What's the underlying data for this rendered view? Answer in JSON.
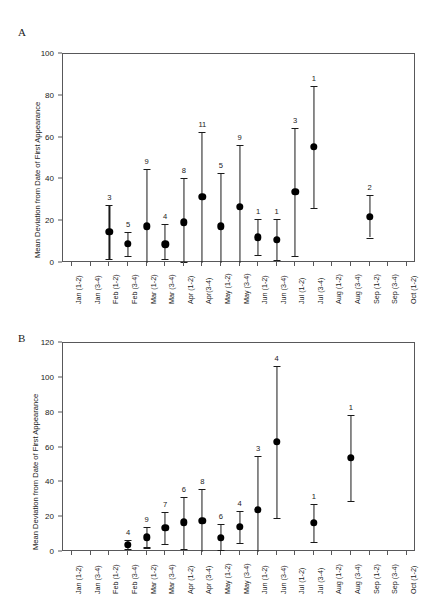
{
  "figure": {
    "panels": [
      {
        "letter": "A"
      },
      {
        "letter": "B"
      }
    ]
  },
  "chart_data": [
    {
      "panel": "A",
      "type": "scatter",
      "title": "",
      "xlabel": "",
      "ylabel": "Mean Deviation from Date of First Appearance",
      "ylim": [
        0,
        100
      ],
      "yticks": [
        0,
        20,
        40,
        60,
        80,
        100
      ],
      "ytick_labels": [
        "0",
        "20",
        "40",
        "60",
        "80",
        "100"
      ],
      "grid": false,
      "legend": "none",
      "categories": [
        "Jan (1-2)",
        "Jan (3-4)",
        "Feb (1-2)",
        "Feb (3-4)",
        "Mar (1-2)",
        "Mar (3-4)",
        "Apr (1-2)",
        "Apr(3-4)",
        "May (1-2)",
        "May (3-4)",
        "Jun (1-2)",
        "Jun (3-4)",
        "Jul (1-2)",
        "Jul (3-4)",
        "Aug (1-2)",
        "Aug (3-4)",
        "Sep (1-2)",
        "Sep (3-4)",
        "Oct (1-2)"
      ],
      "points": [
        {
          "category": "Feb (1-2)",
          "index": 2,
          "mean": 15.0,
          "lower": 1.8,
          "upper": 27.8,
          "n": "3"
        },
        {
          "category": "Feb (3-4)",
          "index": 3,
          "mean": 9.2,
          "lower": 3.5,
          "upper": 15.0,
          "n": "5"
        },
        {
          "category": "Mar (1-2)",
          "index": 4,
          "mean": 17.5,
          "lower": 0.0,
          "upper": 45.0,
          "n": "9"
        },
        {
          "category": "Mar (3-4)",
          "index": 5,
          "mean": 9.0,
          "lower": 2.0,
          "upper": 18.5,
          "n": "4"
        },
        {
          "category": "Apr (1-2)",
          "index": 6,
          "mean": 19.5,
          "lower": 0.7,
          "upper": 40.5,
          "n": "8"
        },
        {
          "category": "Apr(3-4)",
          "index": 7,
          "mean": 31.8,
          "lower": 0.0,
          "upper": 62.5,
          "n": "11"
        },
        {
          "category": "May (1-2)",
          "index": 8,
          "mean": 17.6,
          "lower": 0.0,
          "upper": 43.0,
          "n": "5"
        },
        {
          "category": "May (3-4)",
          "index": 9,
          "mean": 27.0,
          "lower": 0.0,
          "upper": 56.5,
          "n": "9"
        },
        {
          "category": "Jun (1-2)",
          "index": 10,
          "mean": 12.3,
          "lower": 3.7,
          "upper": 21.0,
          "n": "1"
        },
        {
          "category": "Jun (3-4)",
          "index": 11,
          "mean": 11.2,
          "lower": 1.5,
          "upper": 21.0,
          "n": "1"
        },
        {
          "category": "Jul (1-2)",
          "index": 12,
          "mean": 34.0,
          "lower": 3.2,
          "upper": 64.5,
          "n": "3"
        },
        {
          "category": "Jul (3-4)",
          "index": 13,
          "mean": 55.5,
          "lower": 26.3,
          "upper": 84.5,
          "n": "1"
        },
        {
          "category": "Sep (1-2)",
          "index": 16,
          "mean": 22.2,
          "lower": 12.2,
          "upper": 32.4,
          "n": "2"
        }
      ]
    },
    {
      "panel": "B",
      "type": "scatter",
      "title": "",
      "xlabel": "",
      "ylabel": "Mean Deviation from Date of First Appearance",
      "ylim": [
        0,
        120
      ],
      "yticks": [
        0,
        20,
        40,
        60,
        80,
        100,
        120
      ],
      "ytick_labels": [
        "0",
        "20",
        "40",
        "60",
        "80",
        "100",
        "120"
      ],
      "grid": false,
      "legend": "none",
      "categories": [
        "Jan (1-2)",
        "Jan (3-4)",
        "Feb (1-2)",
        "Feb (3-4)",
        "Mar (1-2)",
        "Mar (3-4)",
        "Apr (1-2)",
        "Apr (3-4)",
        "May (1-2)",
        "May (3-4)",
        "Jun (1-2)",
        "Jun (3-4)",
        "Jul (1-2)",
        "Jul (3-4)",
        "Aug (1-2)",
        "Aug (3-4)",
        "Sep (1-2)",
        "Sep (3-4)",
        "Oct (1-2)"
      ],
      "points": [
        {
          "category": "Feb (3-4)",
          "index": 3,
          "mean": 4.3,
          "lower": 1.8,
          "upper": 6.8,
          "n": "4"
        },
        {
          "category": "Mar (1-2)",
          "index": 4,
          "mean": 8.5,
          "lower": 2.6,
          "upper": 14.3,
          "n": "9"
        },
        {
          "category": "Mar (3-4)",
          "index": 5,
          "mean": 13.8,
          "lower": 4.7,
          "upper": 23.0,
          "n": "7"
        },
        {
          "category": "Apr (1-2)",
          "index": 6,
          "mean": 17.0,
          "lower": 1.5,
          "upper": 31.8,
          "n": "6"
        },
        {
          "category": "Apr (3-4)",
          "index": 7,
          "mean": 18.0,
          "lower": 0.0,
          "upper": 36.0,
          "n": "8"
        },
        {
          "category": "May (1-2)",
          "index": 8,
          "mean": 8.2,
          "lower": 1.0,
          "upper": 16.0,
          "n": "6"
        },
        {
          "category": "May (3-4)",
          "index": 9,
          "mean": 14.5,
          "lower": 5.2,
          "upper": 23.5,
          "n": "4"
        },
        {
          "category": "Jun (1-2)",
          "index": 10,
          "mean": 24.2,
          "lower": 0.0,
          "upper": 55.0,
          "n": "3"
        },
        {
          "category": "Jun (3-4)",
          "index": 11,
          "mean": 63.2,
          "lower": 19.8,
          "upper": 107.0,
          "n": "4"
        },
        {
          "category": "Jul (3-4)",
          "index": 13,
          "mean": 16.7,
          "lower": 6.0,
          "upper": 27.5,
          "n": "1"
        },
        {
          "category": "Aug (3-4)",
          "index": 15,
          "mean": 54.0,
          "lower": 29.5,
          "upper": 78.8,
          "n": "1"
        }
      ]
    }
  ]
}
